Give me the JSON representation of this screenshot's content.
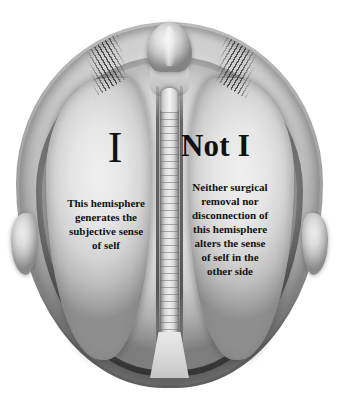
{
  "figure": {
    "background_color": "#ffffff",
    "text_color": "#111111",
    "width": 339,
    "height": 411
  },
  "anatomy": {
    "skull_label": "skull-outline",
    "nose_label": "nose",
    "suture_left_label": "cranial-suture-left",
    "suture_right_label": "cranial-suture-right",
    "hemisphere_left_label": "left-hemisphere",
    "hemisphere_right_label": "right-hemisphere",
    "midline_label": "corpus-callosum-column",
    "stem_label": "brainstem-wedge",
    "lateral_left_label": "temporal-protrusion-left",
    "lateral_right_label": "temporal-protrusion-right"
  },
  "left_hemisphere": {
    "heading": "I",
    "body_lines": [
      "This hemisphere",
      "generates the",
      "subjective sense",
      "of self"
    ],
    "body_text": "This hemisphere generates the subjective sense of self"
  },
  "right_hemisphere": {
    "heading": "Not I",
    "body_lines": [
      "Neither surgical",
      "removal nor",
      "disconnection of",
      "this hemisphere",
      "alters the sense",
      "of self in the",
      "other side"
    ],
    "body_text": "Neither surgical removal nor disconnection of this hemisphere alters the sense of self in the other side"
  }
}
